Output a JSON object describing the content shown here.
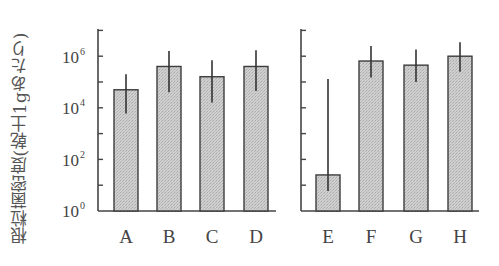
{
  "chart_data": [
    {
      "type": "bar",
      "panel": "left",
      "categories": [
        "A",
        "B",
        "C",
        "D"
      ],
      "values": [
        50000,
        400000,
        160000,
        400000
      ],
      "error_low": [
        6000,
        40000,
        16000,
        45000
      ],
      "error_high": [
        200000,
        1600000,
        700000,
        1700000
      ],
      "yscale": "log",
      "ylim": [
        1,
        10000000
      ],
      "ylabel": "根粒菌密度(乾土1gあたり)",
      "xlabel": "",
      "grid": false
    },
    {
      "type": "bar",
      "panel": "right",
      "categories": [
        "E",
        "F",
        "G",
        "H"
      ],
      "values": [
        25,
        650000,
        450000,
        1000000
      ],
      "error_low": [
        6,
        150000,
        100000,
        250000
      ],
      "error_high": [
        130000,
        2500000,
        1800000,
        3500000
      ],
      "yscale": "log",
      "ylim": [
        1,
        10000000
      ],
      "ylabel": "",
      "xlabel": "",
      "grid": false
    }
  ],
  "axis": {
    "ylabel": "根粒菌密度(乾土1gあたり)",
    "tick_labels": [
      {
        "base": "10",
        "exp": "6"
      },
      {
        "base": "10",
        "exp": "4"
      },
      {
        "base": "10",
        "exp": "2"
      },
      {
        "base": "10",
        "exp": "0"
      }
    ]
  },
  "categories": [
    "A",
    "B",
    "C",
    "D",
    "E",
    "F",
    "G",
    "H"
  ],
  "colors": {
    "bar_fill": "#c9c9c9",
    "bar_stroke": "#3d3d3d",
    "axis": "#444444",
    "error_bar": "#333333"
  }
}
